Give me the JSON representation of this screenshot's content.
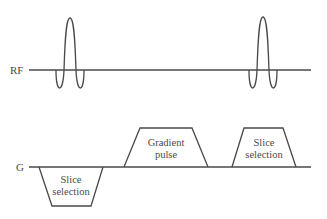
{
  "diagram": {
    "type": "pulse-sequence",
    "colors": {
      "line": "#4a4a4a",
      "text": "#4a4a4a",
      "background": "#ffffff"
    },
    "rf_axis": {
      "label": "RF",
      "pulses": [
        {
          "name": "rf-pulse-1",
          "shape": "sinc"
        },
        {
          "name": "rf-pulse-2",
          "shape": "sinc"
        }
      ]
    },
    "gradient_axis": {
      "label": "G",
      "lobes": [
        {
          "name": "slice-selection-negative",
          "line1": "Slice",
          "line2": "selection",
          "polarity": "negative"
        },
        {
          "name": "gradient-pulse",
          "line1": "Gradient",
          "line2": "pulse",
          "polarity": "positive"
        },
        {
          "name": "slice-selection-positive",
          "line1": "Slice",
          "line2": "selection",
          "polarity": "positive"
        }
      ]
    }
  }
}
